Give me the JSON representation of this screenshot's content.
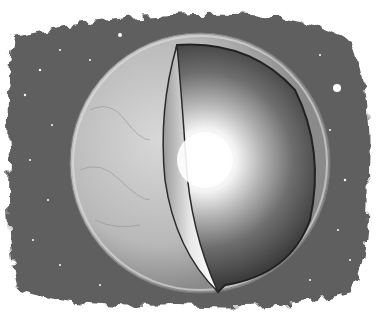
{
  "image": {
    "description": "Grayscale illustration of a planet (Earth) against a starry space backdrop with a wedge cut away revealing layered interior and a glowing bright core",
    "colors": {
      "background": "#ffffff",
      "space": "#5e5e5e",
      "crust": "#bdbdbd",
      "mantle_dark": "#4a4a4a",
      "core_glow": "#ffffff"
    }
  }
}
